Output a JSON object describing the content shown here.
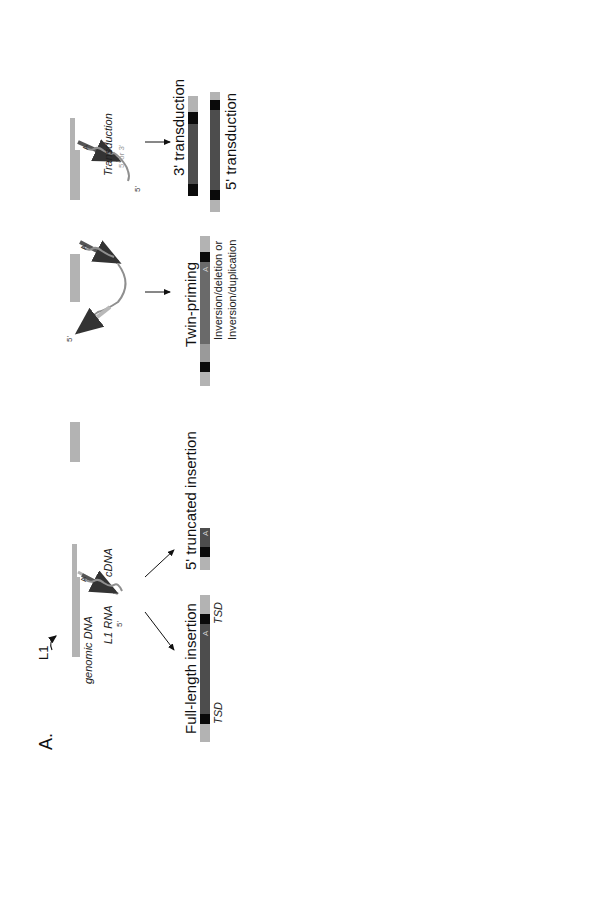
{
  "figure": {
    "orientation": "rotated 90 degrees counter-clockwise",
    "colors": {
      "genomic_dna": "#b3b3b3",
      "l1_insert": "#4d4d4d",
      "tsd": "#0a0a0a",
      "cdna_arrow": "#555555",
      "rna_wave": "#8f8f8f",
      "light_arrow": "#b8b8b8",
      "background": "#ffffff"
    }
  },
  "panel_a": {
    "label": "A.",
    "tprt": {
      "l1_label": "L1",
      "genomic_dna_label": "genomic DNA",
      "l1_rna_label": "L1 RNA",
      "cdna_label": "cDNA",
      "five_prime": "5'",
      "poly_a": "A",
      "outcomes": [
        {
          "title": "Full-length insertion",
          "tsd_left": "TSD",
          "tsd_right": "TSD",
          "poly_a": "A"
        },
        {
          "title": "5' truncated insertion",
          "poly_a": "A"
        }
      ]
    },
    "twin_priming": {
      "five_prime": "5'",
      "poly_a": "A",
      "title": "Twin-priming",
      "subtitle_line1": "Inversion/deletion or",
      "subtitle_line2": "Inversion/duplication"
    },
    "transduction": {
      "label": "Transduction",
      "sublabel": "5' or 3'",
      "five_prime": "5'",
      "poly_a": "A",
      "outcomes": [
        {
          "title": "3' transduction"
        },
        {
          "title": "5' transduction"
        }
      ]
    },
    "template_switch": {
      "rna_label": "U6 snRNA",
      "poly_a": "A",
      "title": "Template switch"
    }
  },
  "panel_b": {
    "label": "B.",
    "dna_damage": {
      "l1_label": "L1",
      "damage_label": "DNA damage",
      "segments": [
        "a",
        "b",
        "c",
        "d"
      ],
      "five_prime": "5'",
      "poly_a": "A",
      "outcomes": [
        {
          "title": "Large deletion",
          "segments": [
            "a",
            "A",
            "c",
            "d"
          ]
        },
        {
          "title": "Large target-site duplication",
          "segments": [
            "a",
            "b",
            "c",
            "A",
            "c",
            "d"
          ]
        }
      ]
    },
    "ssa": {
      "title": "Endogenous L1",
      "segments": [
        "a",
        "A",
        "b",
        "c"
      ],
      "annealing_line1": "Single-Strand",
      "annealing_line2": "Annealing",
      "five_prime": "5'",
      "poly_a": "A",
      "step_line1": "Homologous",
      "step_line2": "Recombination",
      "result_line1": "L1 chimera with",
      "result_line2": "genomic deletion",
      "result_segments": [
        "a",
        "A",
        "c"
      ]
    },
    "sdsa": {
      "title": "Endogenous L1",
      "segments": [
        "a",
        "A",
        "b",
        "c"
      ],
      "twin_label": "Twin-priming",
      "five_prime": "5'",
      "poly_a": "A",
      "annealing_line1": "Synthesis-Dependent",
      "annealing_line2": "Strand Annealing",
      "intermediate_segments": [
        "a",
        "b",
        "c"
      ],
      "step_line1": "Resolution of TPRT",
      "step_line2": "at the initiation site",
      "result_segments": [
        "a",
        "A",
        "b",
        "a",
        "A",
        "c"
      ],
      "tsd_left": "TSD",
      "tsd_right": "TSD",
      "result_line1": "L1 chimera with",
      "result_line2": "intrachromosomal duplication"
    }
  }
}
